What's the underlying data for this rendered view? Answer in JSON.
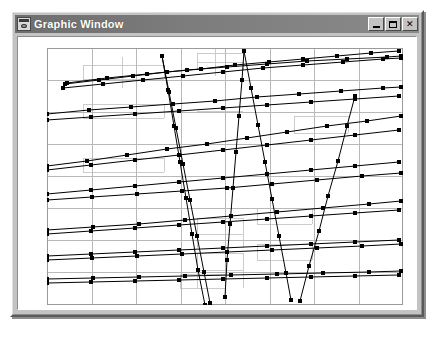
{
  "window": {
    "title": "Graphic Window",
    "icon": "graphic-window-icon",
    "controls": {
      "minimize_label": "_",
      "maximize_label": "□",
      "close_label": "✕"
    },
    "colors": {
      "titlebar_left": "#6e6e6e",
      "titlebar_right": "#8a8a8a",
      "face": "#c3c3c3",
      "client_background": "#ffffff",
      "plot_line": "#000000",
      "grid_major": "#b8b8b8",
      "grid_minor": "#cccccc",
      "plot_border": "#9a9a9a"
    }
  },
  "chart_data": {
    "type": "line",
    "title": "",
    "xlabel": "",
    "ylabel": "",
    "xlim": [
      0,
      356
    ],
    "ylim": [
      0,
      257
    ],
    "grid": true,
    "grid_major_x": [
      0,
      45,
      89,
      134,
      178,
      223,
      267,
      312,
      356
    ],
    "grid_major_y": [
      0,
      32,
      64,
      96,
      128,
      160,
      192,
      224,
      257
    ],
    "grid_minor_segments": [
      {
        "x1": 36,
        "y1": 17,
        "x2": 117,
        "y2": 17
      },
      {
        "x1": 36,
        "y1": 31,
        "x2": 117,
        "y2": 31
      },
      {
        "x1": 36,
        "y1": 17,
        "x2": 36,
        "y2": 31
      },
      {
        "x1": 117,
        "y1": 17,
        "x2": 117,
        "y2": 31
      },
      {
        "x1": 75,
        "y1": 9,
        "x2": 75,
        "y2": 40
      },
      {
        "x1": 150,
        "y1": 5,
        "x2": 196,
        "y2": 5
      },
      {
        "x1": 150,
        "y1": 14,
        "x2": 196,
        "y2": 14
      },
      {
        "x1": 150,
        "y1": 5,
        "x2": 150,
        "y2": 22
      },
      {
        "x1": 196,
        "y1": 5,
        "x2": 196,
        "y2": 22
      },
      {
        "x1": 168,
        "y1": 0,
        "x2": 168,
        "y2": 28
      },
      {
        "x1": 36,
        "y1": 56,
        "x2": 117,
        "y2": 56
      },
      {
        "x1": 36,
        "y1": 70,
        "x2": 117,
        "y2": 70
      },
      {
        "x1": 36,
        "y1": 56,
        "x2": 36,
        "y2": 70
      },
      {
        "x1": 117,
        "y1": 56,
        "x2": 117,
        "y2": 70
      },
      {
        "x1": 150,
        "y1": 63,
        "x2": 196,
        "y2": 63
      },
      {
        "x1": 247,
        "y1": 68,
        "x2": 301,
        "y2": 68
      },
      {
        "x1": 247,
        "y1": 85,
        "x2": 301,
        "y2": 85
      },
      {
        "x1": 247,
        "y1": 68,
        "x2": 247,
        "y2": 85
      },
      {
        "x1": 301,
        "y1": 68,
        "x2": 301,
        "y2": 85
      },
      {
        "x1": 36,
        "y1": 110,
        "x2": 117,
        "y2": 110
      },
      {
        "x1": 36,
        "y1": 124,
        "x2": 117,
        "y2": 124
      },
      {
        "x1": 36,
        "y1": 110,
        "x2": 36,
        "y2": 124
      },
      {
        "x1": 117,
        "y1": 110,
        "x2": 117,
        "y2": 124
      },
      {
        "x1": 150,
        "y1": 170,
        "x2": 196,
        "y2": 170
      },
      {
        "x1": 150,
        "y1": 186,
        "x2": 196,
        "y2": 186
      },
      {
        "x1": 150,
        "y1": 170,
        "x2": 150,
        "y2": 200
      },
      {
        "x1": 196,
        "y1": 170,
        "x2": 196,
        "y2": 200
      },
      {
        "x1": 210,
        "y1": 160,
        "x2": 265,
        "y2": 160
      },
      {
        "x1": 210,
        "y1": 176,
        "x2": 265,
        "y2": 176
      },
      {
        "x1": 210,
        "y1": 160,
        "x2": 210,
        "y2": 176
      },
      {
        "x1": 265,
        "y1": 160,
        "x2": 265,
        "y2": 176
      },
      {
        "x1": 150,
        "y1": 205,
        "x2": 196,
        "y2": 205
      },
      {
        "x1": 150,
        "y1": 222,
        "x2": 196,
        "y2": 222
      },
      {
        "x1": 150,
        "y1": 205,
        "x2": 150,
        "y2": 240
      },
      {
        "x1": 196,
        "y1": 205,
        "x2": 196,
        "y2": 240
      },
      {
        "x1": 133,
        "y1": 226,
        "x2": 178,
        "y2": 226
      },
      {
        "x1": 133,
        "y1": 240,
        "x2": 178,
        "y2": 240
      },
      {
        "x1": 133,
        "y1": 226,
        "x2": 133,
        "y2": 240
      },
      {
        "x1": 178,
        "y1": 226,
        "x2": 178,
        "y2": 240
      },
      {
        "x1": 210,
        "y1": 196,
        "x2": 265,
        "y2": 196
      },
      {
        "x1": 210,
        "y1": 212,
        "x2": 265,
        "y2": 212
      },
      {
        "x1": 210,
        "y1": 196,
        "x2": 210,
        "y2": 212
      },
      {
        "x1": 265,
        "y1": 196,
        "x2": 265,
        "y2": 212
      }
    ],
    "series": [
      {
        "name": "series-1",
        "points": [
          [
            18,
            36
          ],
          [
            52,
            32
          ],
          [
            86,
            28
          ],
          [
            120,
            24
          ],
          [
            154,
            21
          ],
          [
            188,
            17
          ],
          [
            222,
            14
          ],
          [
            256,
            11
          ],
          [
            290,
            8
          ],
          [
            324,
            5
          ],
          [
            352,
            3
          ]
        ]
      },
      {
        "name": "series-2",
        "points": [
          [
            20,
            35
          ],
          [
            60,
            30
          ],
          [
            100,
            26
          ],
          [
            140,
            22
          ],
          [
            180,
            19
          ],
          [
            220,
            16
          ],
          [
            260,
            13
          ],
          [
            300,
            11
          ],
          [
            340,
            9
          ],
          [
            354,
            8
          ]
        ]
      },
      {
        "name": "series-3",
        "points": [
          [
            16,
            40
          ],
          [
            56,
            36
          ],
          [
            96,
            32
          ],
          [
            136,
            28
          ],
          [
            176,
            24
          ],
          [
            216,
            20
          ],
          [
            256,
            17
          ],
          [
            296,
            14
          ],
          [
            336,
            11
          ],
          [
            354,
            10
          ]
        ]
      },
      {
        "name": "series-4",
        "points": [
          [
            0,
            118
          ],
          [
            40,
            113
          ],
          [
            80,
            107
          ],
          [
            120,
            101
          ],
          [
            160,
            96
          ],
          [
            200,
            90
          ],
          [
            240,
            84
          ],
          [
            280,
            78
          ],
          [
            320,
            73
          ],
          [
            354,
            68
          ]
        ]
      },
      {
        "name": "series-5",
        "points": [
          [
            0,
            122
          ],
          [
            44,
            117
          ],
          [
            88,
            112
          ],
          [
            132,
            107
          ],
          [
            176,
            102
          ],
          [
            220,
            97
          ],
          [
            264,
            92
          ],
          [
            308,
            87
          ],
          [
            352,
            82
          ]
        ]
      },
      {
        "name": "series-6",
        "points": [
          [
            0,
            66
          ],
          [
            42,
            62
          ],
          [
            84,
            59
          ],
          [
            126,
            56
          ],
          [
            168,
            53
          ],
          [
            210,
            49
          ],
          [
            252,
            46
          ],
          [
            294,
            43
          ],
          [
            336,
            40
          ],
          [
            354,
            39
          ]
        ]
      },
      {
        "name": "series-7",
        "points": [
          [
            0,
            72
          ],
          [
            44,
            69
          ],
          [
            88,
            66
          ],
          [
            132,
            63
          ],
          [
            176,
            60
          ],
          [
            220,
            57
          ],
          [
            264,
            54
          ],
          [
            308,
            51
          ],
          [
            352,
            48
          ]
        ]
      },
      {
        "name": "series-8",
        "points": [
          [
            0,
            146
          ],
          [
            44,
            142
          ],
          [
            88,
            138
          ],
          [
            132,
            134
          ],
          [
            176,
            130
          ],
          [
            220,
            126
          ],
          [
            264,
            122
          ],
          [
            308,
            118
          ],
          [
            352,
            114
          ]
        ]
      },
      {
        "name": "series-9",
        "points": [
          [
            0,
            152
          ],
          [
            45,
            149
          ],
          [
            90,
            146
          ],
          [
            135,
            143
          ],
          [
            180,
            140
          ],
          [
            225,
            136
          ],
          [
            270,
            132
          ],
          [
            315,
            128
          ],
          [
            354,
            125
          ]
        ]
      },
      {
        "name": "series-10",
        "points": [
          [
            0,
            186
          ],
          [
            44,
            183
          ],
          [
            88,
            180
          ],
          [
            132,
            177
          ],
          [
            176,
            174
          ],
          [
            220,
            171
          ],
          [
            264,
            168
          ],
          [
            308,
            165
          ],
          [
            352,
            162
          ]
        ]
      },
      {
        "name": "series-11",
        "points": [
          [
            0,
            182
          ],
          [
            46,
            179
          ],
          [
            92,
            176
          ],
          [
            138,
            172
          ],
          [
            184,
            168
          ],
          [
            230,
            164
          ],
          [
            276,
            160
          ],
          [
            322,
            156
          ],
          [
            354,
            153
          ]
        ]
      },
      {
        "name": "series-12",
        "points": [
          [
            0,
            208
          ],
          [
            44,
            206
          ],
          [
            88,
            204
          ],
          [
            132,
            202
          ],
          [
            176,
            200
          ],
          [
            220,
            198
          ],
          [
            264,
            196
          ],
          [
            308,
            194
          ],
          [
            352,
            192
          ]
        ]
      },
      {
        "name": "series-13",
        "points": [
          [
            0,
            212
          ],
          [
            45,
            210
          ],
          [
            90,
            208
          ],
          [
            135,
            206
          ],
          [
            180,
            204
          ],
          [
            225,
            202
          ],
          [
            270,
            200
          ],
          [
            315,
            198
          ],
          [
            354,
            196
          ]
        ]
      },
      {
        "name": "series-14",
        "points": [
          [
            0,
            235
          ],
          [
            44,
            234
          ],
          [
            88,
            233
          ],
          [
            132,
            232
          ],
          [
            176,
            231
          ],
          [
            220,
            230
          ],
          [
            264,
            229
          ],
          [
            308,
            228
          ],
          [
            352,
            227
          ]
        ]
      },
      {
        "name": "series-15",
        "points": [
          [
            0,
            231
          ],
          [
            46,
            230
          ],
          [
            92,
            229
          ],
          [
            138,
            228
          ],
          [
            184,
            227
          ],
          [
            230,
            226
          ],
          [
            276,
            225
          ],
          [
            322,
            224
          ],
          [
            354,
            223
          ]
        ]
      },
      {
        "name": "series-zigzag-a",
        "points": [
          [
            158,
            257
          ],
          [
            151,
            222
          ],
          [
            145,
            186
          ],
          [
            139,
            150
          ],
          [
            133,
            114
          ],
          [
            127,
            78
          ],
          [
            121,
            42
          ],
          [
            115,
            8
          ],
          [
            122,
            44
          ],
          [
            129,
            80
          ],
          [
            136,
            116
          ],
          [
            143,
            152
          ],
          [
            150,
            188
          ],
          [
            157,
            224
          ],
          [
            163,
            255
          ]
        ]
      },
      {
        "name": "series-zigzag-b",
        "points": [
          [
            178,
            249
          ],
          [
            180,
            212
          ],
          [
            183,
            176
          ],
          [
            186,
            140
          ],
          [
            189,
            104
          ],
          [
            192,
            68
          ],
          [
            195,
            32
          ],
          [
            197,
            3
          ],
          [
            204,
            40
          ],
          [
            211,
            77
          ],
          [
            218,
            114
          ],
          [
            225,
            151
          ],
          [
            232,
            188
          ],
          [
            239,
            225
          ],
          [
            244,
            252
          ]
        ]
      },
      {
        "name": "series-zigzag-c",
        "points": [
          [
            253,
            253
          ],
          [
            262,
            218
          ],
          [
            272,
            183
          ],
          [
            281,
            148
          ],
          [
            291,
            113
          ],
          [
            300,
            78
          ],
          [
            308,
            48
          ]
        ]
      }
    ],
    "marker": {
      "shape": "square",
      "size": 4,
      "color": "#000000"
    },
    "line": {
      "color": "#000000",
      "width": 1
    }
  }
}
